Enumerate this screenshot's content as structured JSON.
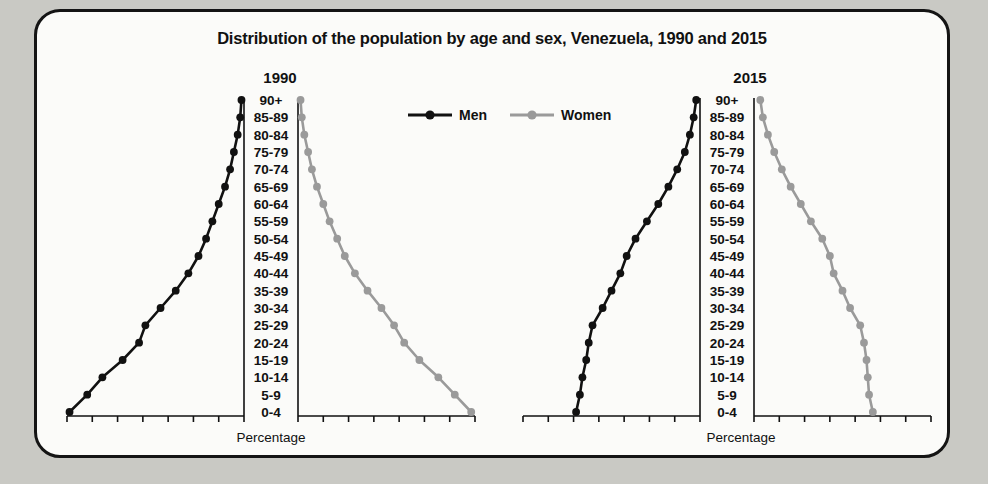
{
  "figure": {
    "title": "Distribution of the population by age and sex, Venezuela, 1990 and 2015",
    "panels": [
      {
        "year_label": "1990",
        "axis_label": "Percentage"
      },
      {
        "year_label": "2015",
        "axis_label": "Percentage"
      }
    ],
    "legend": [
      {
        "label": "Men",
        "color": "#111111"
      },
      {
        "label": "Women",
        "color": "#9a9a9a"
      }
    ]
  },
  "chart_data": {
    "type": "line",
    "title": "Distribution of the population by age and sex, Venezuela, 1990 and 2015",
    "subtitle": "",
    "xlabel": "Percentage",
    "ylabel": "",
    "xlim": [
      0,
      14
    ],
    "xticks": [
      0,
      2,
      4,
      6,
      8,
      10,
      12,
      14
    ],
    "grid": false,
    "legend_position": "top-center",
    "orientation": "horizontal-population-pyramid",
    "categories": [
      "90+",
      "85-89",
      "80-84",
      "75-79",
      "70-74",
      "65-69",
      "60-64",
      "55-59",
      "50-54",
      "45-49",
      "40-44",
      "35-39",
      "30-34",
      "25-29",
      "20-24",
      "15-19",
      "10-14",
      "5-9",
      "0-4"
    ],
    "panels": [
      {
        "year": "1990",
        "men_axis_direction": "reversed",
        "women_axis_direction": "normal",
        "series": [
          {
            "name": "Men",
            "color": "#111111",
            "values": [
              0.2,
              0.3,
              0.5,
              0.8,
              1.1,
              1.5,
              2.0,
              2.5,
              3.0,
              3.6,
              4.4,
              5.4,
              6.6,
              7.8,
              8.3,
              9.6,
              11.2,
              12.4,
              13.8
            ]
          },
          {
            "name": "Women",
            "color": "#9a9a9a",
            "values": [
              0.2,
              0.3,
              0.5,
              0.8,
              1.1,
              1.5,
              2.0,
              2.5,
              3.1,
              3.7,
              4.5,
              5.5,
              6.6,
              7.6,
              8.4,
              9.6,
              11.1,
              12.4,
              13.7
            ]
          }
        ]
      },
      {
        "year": "2015",
        "men_axis_direction": "reversed",
        "women_axis_direction": "normal",
        "series": [
          {
            "name": "Men",
            "color": "#111111",
            "values": [
              0.3,
              0.5,
              0.8,
              1.2,
              1.8,
              2.5,
              3.3,
              4.2,
              5.1,
              5.8,
              6.3,
              7.0,
              7.7,
              8.5,
              8.8,
              9.0,
              9.3,
              9.5,
              9.8
            ]
          },
          {
            "name": "Women",
            "color": "#9a9a9a",
            "values": [
              0.5,
              0.7,
              1.1,
              1.6,
              2.2,
              2.9,
              3.7,
              4.5,
              5.4,
              6.0,
              6.3,
              7.0,
              7.6,
              8.4,
              8.7,
              8.9,
              9.0,
              9.1,
              9.4
            ]
          }
        ]
      }
    ]
  }
}
